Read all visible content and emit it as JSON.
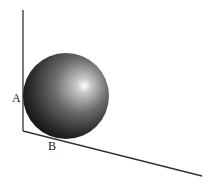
{
  "diagram": {
    "labels": {
      "A": "A",
      "B": "B"
    },
    "colors": {
      "background": "#ffffff",
      "lines": "#333333",
      "sphere_highlight": "#ffffff",
      "sphere_mid": "#8a8a8a",
      "sphere_dark": "#1a1a1a"
    }
  }
}
